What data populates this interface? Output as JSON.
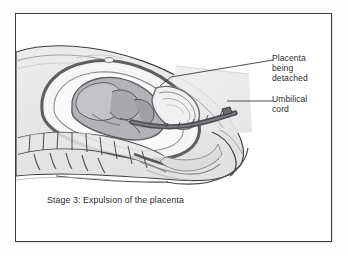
{
  "figure": {
    "caption": "Stage 3: Expulsion of the placenta",
    "frame_color": "#3a3a3c",
    "background_color": "#ffffff"
  },
  "labels": [
    {
      "id": "placenta-being-detached",
      "text": "Placenta\nbeing\ndetached",
      "leader_from": [
        272,
        59
      ],
      "leader_to": [
        170,
        76
      ]
    },
    {
      "id": "umbilical-cord",
      "text": "Umbilical\ncord",
      "leader_from": [
        272,
        100
      ],
      "leader_to": [
        226,
        100
      ]
    }
  ],
  "illustration": {
    "title": "Sagittal cross-section of the female pelvis during the third stage of labour",
    "type": "medical-line-drawing",
    "palette": {
      "outline": "#3c3c3e",
      "skin_fill": "#e9e9e9",
      "uterus_wall": "#6f6f73",
      "uterus_inner": "#f2f2f2",
      "placenta": "#8a8a8e",
      "fetus": "#9a9a9e",
      "bone": "#e2e2e2",
      "cord": "#55555a",
      "soft_tissue": "#d6d6d6"
    },
    "structures": [
      "maternal abdomen outline",
      "uterus wall",
      "placenta being detached",
      "umbilical cord",
      "fetus",
      "sacrum and vertebrae",
      "birth canal",
      "perineum"
    ]
  }
}
